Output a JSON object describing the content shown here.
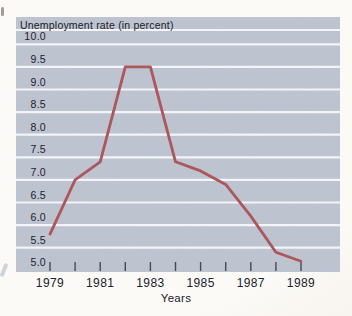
{
  "chart_data": {
    "type": "line",
    "title": "Unemployment rate (in percent)",
    "xlabel": "Years",
    "ylabel": "",
    "x": [
      1979,
      1980,
      1981,
      1982,
      1983,
      1984,
      1985,
      1986,
      1987,
      1988,
      1989
    ],
    "x_tick_labels": [
      "1979",
      "1981",
      "1983",
      "1985",
      "1987",
      "1989"
    ],
    "series": [
      {
        "name": "Unemployment rate",
        "values": [
          5.8,
          7.0,
          7.4,
          9.5,
          9.5,
          7.4,
          7.2,
          6.9,
          6.2,
          5.4,
          5.2
        ]
      }
    ],
    "y_ticks": [
      "10.0",
      "9.5",
      "9.0",
      "8.5",
      "8.0",
      "7.5",
      "7.0",
      "6.5",
      "6.0",
      "5.5",
      "5.0"
    ],
    "ylim": [
      5.0,
      10.0
    ],
    "y_step": 0.5,
    "legend": "none",
    "grid": "horizontal-white-lines-on-band",
    "colors": {
      "band": "#b3bac8",
      "gridline": "#f0f3f6",
      "line": "#9e3c41",
      "text": "#20212c",
      "tick": "#2b2c38",
      "page": "#fbfaf6"
    }
  }
}
